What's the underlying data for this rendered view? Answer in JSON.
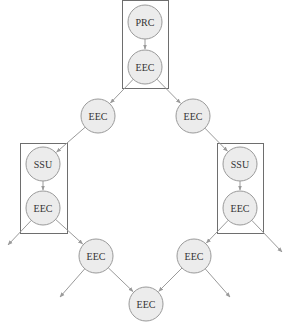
{
  "diagram": {
    "type": "directed-graph",
    "colors": {
      "node_fill": "#ececec",
      "node_stroke": "#9a9a9a",
      "edge": "#9a9a9a",
      "box_stroke": "#6e6e6e",
      "text": "#333333"
    },
    "groups": [
      {
        "id": "g_top",
        "members": [
          "prc",
          "eec1"
        ]
      },
      {
        "id": "g_left",
        "members": [
          "ssu_l",
          "eec_l"
        ]
      },
      {
        "id": "g_right",
        "members": [
          "ssu_r",
          "eec_r"
        ]
      }
    ],
    "nodes": [
      {
        "id": "prc",
        "label": "PRC"
      },
      {
        "id": "eec1",
        "label": "EEC"
      },
      {
        "id": "eec2l",
        "label": "EEC"
      },
      {
        "id": "eec2r",
        "label": "EEC"
      },
      {
        "id": "ssu_l",
        "label": "SSU"
      },
      {
        "id": "eec_l",
        "label": "EEC"
      },
      {
        "id": "ssu_r",
        "label": "SSU"
      },
      {
        "id": "eec_r",
        "label": "EEC"
      },
      {
        "id": "eec3l",
        "label": "EEC"
      },
      {
        "id": "eec3r",
        "label": "EEC"
      },
      {
        "id": "eec4",
        "label": "EEC"
      }
    ],
    "edges": [
      {
        "from": "prc",
        "to": "eec1"
      },
      {
        "from": "eec1",
        "to": "eec2l"
      },
      {
        "from": "eec1",
        "to": "eec2r"
      },
      {
        "from": "eec2l",
        "to": "ssu_l"
      },
      {
        "from": "eec2r",
        "to": "ssu_r"
      },
      {
        "from": "ssu_l",
        "to": "eec_l"
      },
      {
        "from": "ssu_r",
        "to": "eec_r"
      },
      {
        "from": "eec_l",
        "to": "eec3l"
      },
      {
        "from": "eec_r",
        "to": "eec3r"
      },
      {
        "from": "eec3l",
        "to": "eec4"
      },
      {
        "from": "eec3r",
        "to": "eec4"
      },
      {
        "from": "eec_l",
        "to": null,
        "direction": "down-left"
      },
      {
        "from": "eec_r",
        "to": null,
        "direction": "down-right"
      },
      {
        "from": "eec3l",
        "to": null,
        "direction": "down-left"
      },
      {
        "from": "eec3r",
        "to": null,
        "direction": "down-right"
      }
    ]
  }
}
